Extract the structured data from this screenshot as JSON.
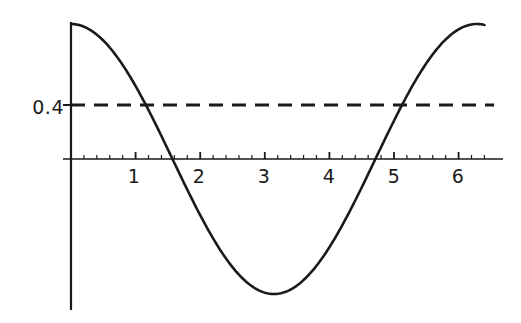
{
  "chart_data": {
    "type": "line",
    "title": "",
    "subtitle": "",
    "xlabel": "",
    "ylabel": "",
    "xlim": [
      -0.06,
      6.62
    ],
    "ylim": [
      -1.0,
      1.0
    ],
    "grid": false,
    "legend": null,
    "background_color": "#ffffff",
    "axis_color": "#1a1a1a",
    "x_ticks_major": [
      1,
      2,
      3,
      4,
      5,
      6
    ],
    "x_tick_labels": [
      "1",
      "2",
      "3",
      "4",
      "5",
      "6"
    ],
    "x_ticks_minor_step": 0.2,
    "y_ticks_major": [
      0.4
    ],
    "y_tick_labels": [
      "0.4"
    ],
    "series": [
      {
        "name": "cosine-curve",
        "style": "solid",
        "color": "#1a1a1a",
        "width": 2.6,
        "function": "cos(x)",
        "x_start": 0,
        "x_end": 6.4,
        "samples": 257,
        "key_points": [
          {
            "x": 0,
            "y": 1.0
          },
          {
            "x": 1.159,
            "y": 0.4
          },
          {
            "x": 1.571,
            "y": 0.0
          },
          {
            "x": 3.142,
            "y": -1.0
          },
          {
            "x": 4.712,
            "y": 0.0
          },
          {
            "x": 5.124,
            "y": 0.4
          },
          {
            "x": 6.283,
            "y": 1.0
          }
        ]
      },
      {
        "name": "threshold-line",
        "style": "dashed",
        "color": "#1a1a1a",
        "width": 3.0,
        "constant_y": 0.4,
        "dash_pattern": "14 9",
        "x_start": 0,
        "x_end": 6.55
      }
    ]
  },
  "axes": {
    "x_axis_name": "x-axis",
    "y_axis_name": "y-axis",
    "x_axis_y_value": 0,
    "y_axis_x_value": 0
  },
  "labels": {
    "y_04": "0.4",
    "x_1": "1",
    "x_2": "2",
    "x_3": "3",
    "x_4": "4",
    "x_5": "5",
    "x_6": "6"
  }
}
